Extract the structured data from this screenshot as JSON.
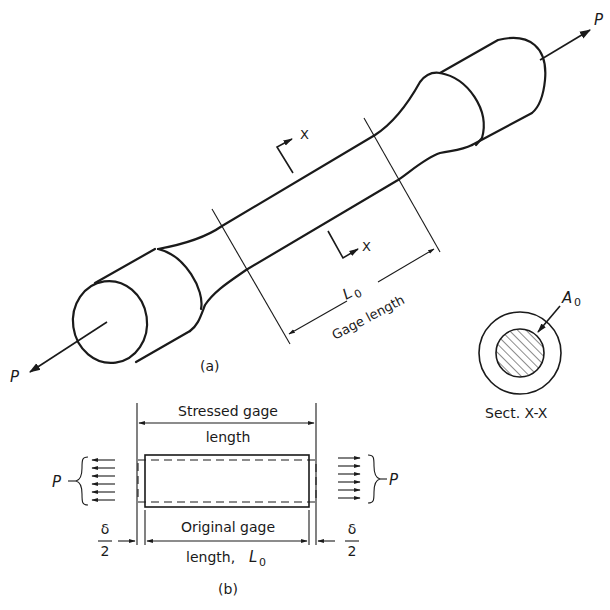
{
  "figure": {
    "part_a": {
      "caption": "(a)",
      "load_label_left": "P",
      "load_label_right": "P",
      "section_marker_top": "X",
      "section_marker_bottom": "X",
      "gage_symbol": "L",
      "gage_symbol_sub": "0",
      "gage_text": "Gage length"
    },
    "section": {
      "area_symbol": "A",
      "area_sub": "0",
      "caption": "Sect. X-X"
    },
    "part_b": {
      "caption": "(b)",
      "stressed_line1": "Stressed gage",
      "stressed_line2": "length",
      "original_line1": "Original gage",
      "original_line2": "length, ",
      "original_symbol": "L",
      "original_sub": "0",
      "load_left": "P",
      "load_right": "P",
      "delta_num": "δ",
      "delta_den": "2"
    },
    "colors": {
      "ink": "#1a1a1a",
      "background": "#ffffff"
    }
  }
}
